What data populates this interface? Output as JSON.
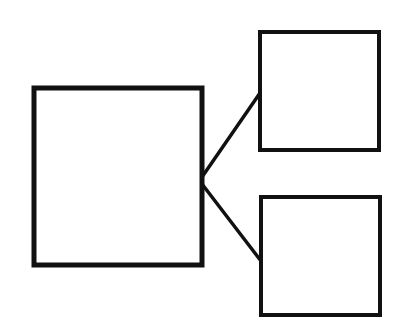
{
  "diagram": {
    "type": "tree",
    "background": "#ffffff",
    "stroke_color": "#111111",
    "nodes": [
      {
        "id": "root",
        "label": "",
        "x": 34,
        "y": 88,
        "width": 168,
        "height": 177,
        "stroke_width": 5
      },
      {
        "id": "child-top",
        "label": "",
        "x": 260,
        "y": 32,
        "width": 119,
        "height": 118,
        "stroke_width": 4
      },
      {
        "id": "child-bottom",
        "label": "",
        "x": 261,
        "y": 197,
        "width": 119,
        "height": 118,
        "stroke_width": 4
      }
    ],
    "edges": [
      {
        "from": "root",
        "to": "child-top",
        "x1": 202,
        "y1": 177,
        "x2": 260,
        "y2": 93,
        "stroke_width": 3.5
      },
      {
        "from": "root",
        "to": "child-bottom",
        "x1": 202,
        "y1": 184,
        "x2": 261,
        "y2": 261,
        "stroke_width": 3.5
      }
    ]
  }
}
